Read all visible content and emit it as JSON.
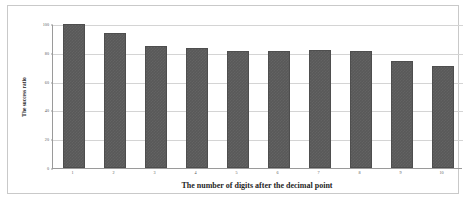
{
  "chart_data": {
    "type": "bar",
    "title": "",
    "xlabel": "The number of digits after the decimal point",
    "ylabel": "The success ratio",
    "categories": [
      "1",
      "2",
      "3",
      "4",
      "5",
      "6",
      "7",
      "8",
      "9",
      "10"
    ],
    "values": [
      100,
      94,
      85,
      83,
      81,
      81,
      82,
      81,
      74,
      71
    ],
    "ylim": [
      0,
      100
    ],
    "yticks": [
      0,
      20,
      40,
      60,
      80,
      100
    ],
    "ytick_labels": [
      "0",
      "20",
      "40",
      "60",
      "80",
      "100"
    ],
    "grid": true,
    "legend": false,
    "series": [
      {
        "name": "The success ratio",
        "values": [
          100,
          94,
          85,
          83,
          81,
          81,
          82,
          81,
          74,
          71
        ],
        "color": "#595959"
      }
    ],
    "colors": {
      "bar": "#595959",
      "bar_border": "#4e4e4e",
      "gridline": "#d4d4d4",
      "axis": "#9a9a9a",
      "frame": "#c9c9c9",
      "background": "#ffffff",
      "tick_text": "#5a5a5a",
      "title_text": "#1f1f1f"
    }
  }
}
